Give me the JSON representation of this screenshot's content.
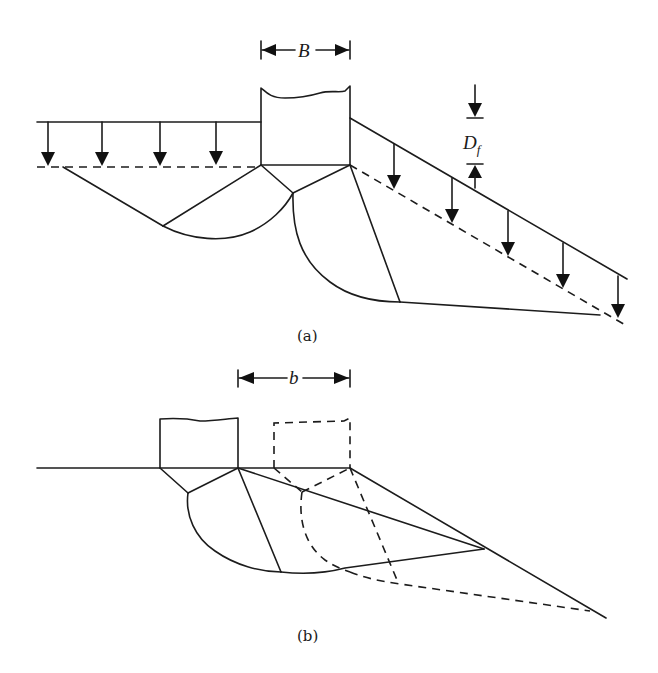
{
  "figure": {
    "panels": [
      {
        "id": "a",
        "caption": "(a)",
        "dimension_label": "B",
        "depth_label_main": "D",
        "depth_label_sub": "f",
        "description": "Footing of width B at depth Df near a slope, with surcharge arrows on level ground (left) and on the slope (right); failure zones shown beneath footing."
      },
      {
        "id": "b",
        "caption": "(b)",
        "dimension_label": "b",
        "description": "Footing on ground surface at distance b from the slope crest; solid failure mechanism for the actual footing and dashed mechanism for the footing located at the crest."
      }
    ]
  },
  "colors": {
    "ink": "#1c1c1c",
    "background": "#ffffff"
  }
}
